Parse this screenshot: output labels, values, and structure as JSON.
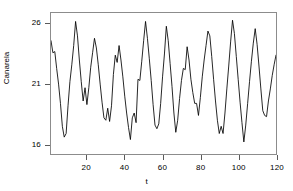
{
  "chart_data": {
    "type": "line",
    "title": "",
    "xlabel": "t",
    "ylabel": "Canarela",
    "xlim": [
      1,
      120
    ],
    "ylim": [
      15.2,
      26.9
    ],
    "grid": false,
    "legend": null,
    "xticks": [
      20,
      40,
      60,
      80,
      100,
      120
    ],
    "yticks": [
      16,
      21,
      26
    ],
    "line_color": "#000000",
    "series": [
      {
        "name": "Canarela",
        "x": [
          1,
          2,
          3,
          4,
          5,
          6,
          7,
          8,
          9,
          10,
          11,
          12,
          13,
          14,
          15,
          16,
          17,
          18,
          19,
          20,
          21,
          22,
          23,
          24,
          25,
          26,
          27,
          28,
          29,
          30,
          31,
          32,
          33,
          34,
          35,
          36,
          37,
          38,
          39,
          40,
          41,
          42,
          43,
          44,
          45,
          46,
          47,
          48,
          49,
          50,
          51,
          52,
          53,
          54,
          55,
          56,
          57,
          58,
          59,
          60,
          61,
          62,
          63,
          64,
          65,
          66,
          67,
          68,
          69,
          70,
          71,
          72,
          73,
          74,
          75,
          76,
          77,
          78,
          79,
          80,
          81,
          82,
          83,
          84,
          85,
          86,
          87,
          88,
          89,
          90,
          91,
          92,
          93,
          94,
          95,
          96,
          97,
          98,
          99,
          100,
          101,
          102,
          103,
          104,
          105,
          106,
          107,
          108,
          109,
          110,
          111,
          112,
          113,
          114,
          115,
          116,
          117,
          118,
          119,
          120
        ],
        "values": [
          24.6,
          23.6,
          23.7,
          22.3,
          21.0,
          19.4,
          17.5,
          16.6,
          16.9,
          19.2,
          21.2,
          22.6,
          24.2,
          26.2,
          25.0,
          23.0,
          21.2,
          19.6,
          20.7,
          19.3,
          20.7,
          22.4,
          23.6,
          24.8,
          24.0,
          22.6,
          21.0,
          19.5,
          18.2,
          18.0,
          19.0,
          17.9,
          19.2,
          21.8,
          23.4,
          22.8,
          24.2,
          23.0,
          21.6,
          20.0,
          18.6,
          17.4,
          16.4,
          18.2,
          18.6,
          17.8,
          21.4,
          21.3,
          22.9,
          24.6,
          26.2,
          24.8,
          23.1,
          21.3,
          19.3,
          17.6,
          17.3,
          17.7,
          19.4,
          21.6,
          23.5,
          25.8,
          24.6,
          22.7,
          20.8,
          18.6,
          17.0,
          18.0,
          19.8,
          21.3,
          22.3,
          22.2,
          24.1,
          23.0,
          21.4,
          20.3,
          19.4,
          19.4,
          18.4,
          19.9,
          21.6,
          23.0,
          24.2,
          25.4,
          25.0,
          23.3,
          21.4,
          19.6,
          18.0,
          16.9,
          17.5,
          16.9,
          18.6,
          20.6,
          22.5,
          24.5,
          26.3,
          25.2,
          23.3,
          21.4,
          19.5,
          17.8,
          16.2,
          17.6,
          19.4,
          21.2,
          22.9,
          24.4,
          25.6,
          24.3,
          22.5,
          20.6,
          18.8,
          18.4,
          18.3,
          19.6,
          20.6,
          21.7,
          22.6,
          23.4
        ]
      }
    ]
  }
}
